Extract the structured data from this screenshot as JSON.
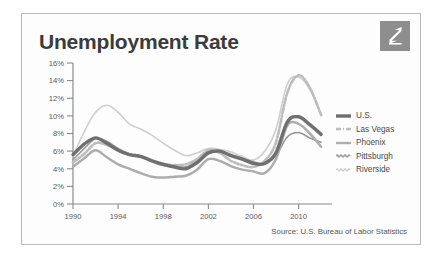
{
  "card": {
    "title": "Unemployment Rate",
    "source": "Source: U.S. Bureau of Labor Statistics",
    "logo_icon": "zillow-z-logo-icon",
    "border_color": "#b9b9b9",
    "logo_bg": "#8e8e8e"
  },
  "chart_data": {
    "type": "line",
    "title": "Unemployment Rate",
    "xlabel": "",
    "ylabel": "",
    "xlim": [
      1990,
      2012
    ],
    "ylim": [
      0,
      16
    ],
    "ytick_labels": [
      "0%",
      "2%",
      "4%",
      "6%",
      "8%",
      "10%",
      "12%",
      "14%",
      "16%"
    ],
    "ytick_values": [
      0,
      2,
      4,
      6,
      8,
      10,
      12,
      14,
      16
    ],
    "xtick_labels": [
      "1990",
      "1994",
      "1998",
      "2002",
      "2006",
      "2010"
    ],
    "xtick_values": [
      1990,
      1994,
      1998,
      2002,
      2006,
      2010
    ],
    "grid": false,
    "legend_position": "right",
    "x": [
      1990,
      1991,
      1992,
      1993,
      1994,
      1995,
      1996,
      1997,
      1998,
      1999,
      2000,
      2001,
      2002,
      2003,
      2004,
      2005,
      2006,
      2007,
      2008,
      2009,
      2010,
      2011,
      2012
    ],
    "series": [
      {
        "name": "U.S.",
        "color": "#707070",
        "style": "solid-thick",
        "values": [
          5.6,
          6.8,
          7.5,
          6.9,
          6.1,
          5.6,
          5.4,
          4.9,
          4.5,
          4.2,
          4.0,
          4.7,
          5.8,
          6.0,
          5.5,
          5.1,
          4.6,
          4.6,
          5.8,
          9.3,
          9.9,
          9.0,
          7.9
        ]
      },
      {
        "name": "Las Vegas",
        "color": "#bdbdbd",
        "style": "dash-dot",
        "values": [
          4.7,
          5.7,
          6.9,
          6.7,
          6.1,
          5.6,
          5.4,
          4.9,
          4.4,
          4.4,
          4.5,
          5.1,
          6.1,
          5.8,
          4.9,
          4.4,
          4.2,
          4.9,
          7.0,
          12.6,
          14.6,
          13.2,
          10.1
        ]
      },
      {
        "name": "Phoenix",
        "color": "#adadad",
        "style": "solid-medium",
        "values": [
          4.2,
          5.2,
          6.1,
          5.3,
          4.5,
          4.0,
          3.5,
          3.1,
          3.0,
          3.1,
          3.2,
          3.9,
          5.1,
          4.9,
          4.3,
          3.9,
          3.7,
          3.5,
          5.1,
          8.9,
          9.1,
          8.0,
          6.5
        ]
      },
      {
        "name": "Pittsburgh",
        "color": "#999999",
        "style": "wavy-thin",
        "values": [
          5.0,
          6.3,
          7.4,
          7.1,
          6.3,
          5.7,
          5.4,
          4.9,
          4.6,
          4.4,
          4.2,
          4.9,
          5.9,
          6.0,
          5.6,
          5.2,
          4.8,
          4.6,
          5.5,
          7.6,
          8.1,
          7.5,
          7.0
        ]
      },
      {
        "name": "Riverside",
        "color": "#cfcfcf",
        "style": "wavy-thin-light",
        "values": [
          5.4,
          8.2,
          10.4,
          11.2,
          10.4,
          9.1,
          8.5,
          7.8,
          6.9,
          6.1,
          5.5,
          5.8,
          6.3,
          6.2,
          5.9,
          5.4,
          5.0,
          6.0,
          8.5,
          13.6,
          14.4,
          13.0,
          10.2
        ]
      }
    ]
  },
  "legend": {
    "items": [
      {
        "label": "U.S.",
        "icon": "legend-swatch-solid-thick"
      },
      {
        "label": "Las Vegas",
        "icon": "legend-swatch-dash-dot"
      },
      {
        "label": "Phoenix",
        "icon": "legend-swatch-solid"
      },
      {
        "label": "Pittsburgh",
        "icon": "legend-swatch-wavy"
      },
      {
        "label": "Riverside",
        "icon": "legend-swatch-wavy-light"
      }
    ]
  }
}
